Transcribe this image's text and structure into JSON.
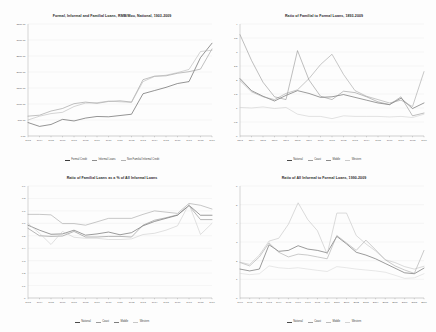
{
  "page": {
    "background": "#fdfdfd",
    "layout": "2x2 grid of line charts"
  },
  "chart_data": [
    {
      "id": "formal-informal-familial-loans",
      "type": "line",
      "title": "Formal, Informal and Familial Loans, RMB/Mou, National, 1903-2009",
      "xlabel": "",
      "ylabel": "",
      "ylim": [
        0,
        3500
      ],
      "yticks": [
        0,
        500,
        1000,
        1500,
        2000,
        2500,
        3000,
        3500
      ],
      "ytick_labels": [
        "0.00",
        "500.00",
        "1000.00",
        "1500.00",
        "2000.00",
        "2500.00",
        "3000.00",
        "3500.00"
      ],
      "grid": true,
      "legend_position": "bottom",
      "x": [
        "1903",
        "1904",
        "1905",
        "1906",
        "1907",
        "1908",
        "1909",
        "1910",
        "1911",
        "1912",
        "1913",
        "1914",
        "1915",
        "1916",
        "1917",
        "1918",
        "1919"
      ],
      "categories": [
        "1903",
        "1904",
        "1905",
        "1906",
        "1907",
        "1908",
        "1909",
        "1910",
        "1911",
        "1912",
        "1913",
        "1914",
        "1915",
        "1916",
        "1917",
        "1918",
        "1919"
      ],
      "series": [
        {
          "name": "Formal Credit",
          "color": "#3c3c3c",
          "values": [
            420,
            300,
            360,
            520,
            470,
            560,
            610,
            600,
            640,
            680,
            1320,
            1420,
            1520,
            1640,
            1700,
            2450,
            2900
          ]
        },
        {
          "name": "Informal Loans",
          "color": "#8e8e8e",
          "values": [
            620,
            650,
            780,
            860,
            1010,
            1060,
            1020,
            1080,
            1100,
            1060,
            1760,
            1870,
            1880,
            1960,
            2010,
            2090,
            2720
          ]
        },
        {
          "name": "Non Familial Informal Credit",
          "color": "#b2b2b2",
          "values": [
            500,
            620,
            700,
            740,
            920,
            1030,
            1040,
            1090,
            1070,
            1050,
            1700,
            1860,
            1900,
            1980,
            2080,
            2640,
            2680
          ]
        }
      ],
      "legend": [
        "Formal Credit",
        "Informal Loans",
        "Non Familial Informal Credit"
      ]
    },
    {
      "id": "ratio-familial-to-formal",
      "type": "line",
      "title": "Ratio of Familial to Formal Loans, 1893-2009",
      "xlabel": "",
      "ylabel": "",
      "ylim": [
        0,
        4
      ],
      "yticks": [
        0,
        0.5,
        1,
        1.5,
        2,
        2.5,
        3,
        3.5,
        4
      ],
      "ytick_labels": [
        "0",
        "0.5",
        "1",
        "1.5",
        "2",
        "2.5",
        "3",
        "3.5",
        "4"
      ],
      "grid": true,
      "legend_position": "bottom",
      "x": [
        "1893",
        "1894",
        "1895",
        "1896",
        "1897",
        "1898",
        "1899",
        "1900",
        "1901",
        "1902",
        "1903",
        "1904",
        "1905",
        "1906",
        "1907",
        "1908",
        "1909"
      ],
      "categories": [
        "1893",
        "1894",
        "1895",
        "1896",
        "1897",
        "1898",
        "1899",
        "1900",
        "1901",
        "1902",
        "1903",
        "1904",
        "1905",
        "1906",
        "1907",
        "1908",
        "1909"
      ],
      "series": [
        {
          "name": "National",
          "color": "#4a4a4a",
          "values": [
            2.05,
            1.62,
            1.42,
            1.25,
            1.45,
            1.62,
            1.52,
            1.38,
            1.4,
            1.48,
            1.38,
            1.28,
            1.18,
            1.12,
            1.35,
            0.98,
            1.18
          ]
        },
        {
          "name": "Coast",
          "color": "#9b9b9b",
          "values": [
            1.98,
            1.58,
            1.4,
            1.3,
            1.52,
            1.65,
            2.05,
            2.55,
            2.92,
            2.2,
            1.62,
            1.42,
            1.3,
            1.18,
            1.28,
            1.05,
            2.3
          ]
        },
        {
          "name": "Middle",
          "color": "#8a8a8a",
          "values": [
            3.62,
            2.7,
            1.92,
            1.4,
            1.3,
            3.05,
            2.0,
            1.42,
            1.3,
            1.6,
            1.55,
            1.4,
            1.22,
            1.12,
            1.4,
            0.72,
            0.82
          ]
        },
        {
          "name": "Western",
          "color": "#cbcbcb",
          "values": [
            1.02,
            1.0,
            1.04,
            0.98,
            1.02,
            0.78,
            0.7,
            0.7,
            0.62,
            0.72,
            0.7,
            0.7,
            0.7,
            0.68,
            0.7,
            0.66,
            0.78
          ]
        }
      ],
      "legend": [
        "National",
        "Coast",
        "Middle",
        "Western"
      ]
    },
    {
      "id": "familial-share-of-informal",
      "type": "line",
      "title": "Ratio of Familial Loans as a % of All Informal Loans",
      "xlabel": "",
      "ylabel": "",
      "ylim": [
        0,
        0.9
      ],
      "yticks": [
        0,
        0.1,
        0.2,
        0.3,
        0.4,
        0.5,
        0.6,
        0.7,
        0.8,
        0.9
      ],
      "ytick_labels": [
        "0",
        "0.1",
        "0.2",
        "0.3",
        "0.4",
        "0.5",
        "0.6",
        "0.7",
        "0.8",
        "0.9"
      ],
      "grid": true,
      "legend_position": "bottom",
      "x": [
        "1903",
        "1904",
        "1905",
        "1906",
        "1907",
        "1908",
        "1909",
        "1910",
        "1911",
        "1912",
        "1913",
        "1914",
        "1915",
        "1916",
        "1917",
        "1918",
        "1919"
      ],
      "categories": [
        "1903",
        "1904",
        "1905",
        "1906",
        "1907",
        "1908",
        "1909",
        "1910",
        "1911",
        "1912",
        "1913",
        "1914",
        "1915",
        "1916",
        "1917",
        "1918",
        "1919"
      ],
      "series": [
        {
          "name": "National",
          "color": "#4a4a4a",
          "values": [
            0.585,
            0.545,
            0.512,
            0.515,
            0.545,
            0.505,
            0.515,
            0.53,
            0.508,
            0.525,
            0.58,
            0.615,
            0.64,
            0.665,
            0.745,
            0.665,
            0.665
          ]
        },
        {
          "name": "Coast",
          "color": "#9b9b9b",
          "values": [
            0.672,
            0.672,
            0.668,
            0.598,
            0.598,
            0.585,
            0.612,
            0.64,
            0.64,
            0.64,
            0.672,
            0.7,
            0.69,
            0.68,
            0.76,
            0.745,
            0.715
          ]
        },
        {
          "name": "Middle",
          "color": "#7d7d7d",
          "values": [
            0.56,
            0.5,
            0.495,
            0.498,
            0.535,
            0.49,
            0.49,
            0.495,
            0.495,
            0.49,
            0.585,
            0.625,
            0.645,
            0.668,
            0.742,
            0.63,
            0.63
          ]
        },
        {
          "name": "Western",
          "color": "#c8c8c8",
          "values": [
            0.6,
            0.52,
            0.43,
            0.535,
            0.488,
            0.48,
            0.48,
            0.47,
            0.47,
            0.475,
            0.51,
            0.52,
            0.545,
            0.58,
            0.755,
            0.51,
            0.6
          ]
        }
      ],
      "legend": [
        "National",
        "Coast",
        "Middle",
        "Western"
      ]
    },
    {
      "id": "ratio-informal-to-formal",
      "type": "line",
      "title": "Ratio of All Informal to Formal Loans, 1990-2009",
      "xlabel": "",
      "ylabel": "",
      "ylim": [
        0,
        6
      ],
      "yticks": [
        0,
        1,
        2,
        3,
        4,
        5,
        6
      ],
      "ytick_labels": [
        "0",
        "1",
        "2",
        "3",
        "4",
        "5",
        "6"
      ],
      "grid": true,
      "legend_position": "bottom",
      "x": [
        "1990",
        "1991",
        "1992",
        "1993",
        "1994",
        "1995",
        "1996",
        "1997",
        "1998",
        "1999",
        "2000",
        "2001",
        "2002",
        "2003",
        "2004",
        "2005",
        "2006",
        "2007",
        "2008",
        "2009"
      ],
      "categories": [
        "1990",
        "1991",
        "1992",
        "1993",
        "1994",
        "1995",
        "1996",
        "1997",
        "1998",
        "1999",
        "2000",
        "2001",
        "2002",
        "2003",
        "2004",
        "2005",
        "2006",
        "2007",
        "2008",
        "2009"
      ],
      "series": [
        {
          "name": "National",
          "color": "#4a4a4a",
          "values": [
            1.55,
            1.45,
            1.55,
            2.85,
            2.5,
            2.55,
            2.8,
            2.62,
            2.55,
            2.42,
            3.3,
            2.9,
            2.45,
            2.3,
            2.1,
            1.85,
            1.6,
            1.35,
            1.3,
            1.6
          ]
        },
        {
          "name": "Coast",
          "color": "#a0a0a0",
          "values": [
            1.9,
            1.72,
            2.2,
            2.95,
            2.45,
            2.2,
            2.35,
            2.3,
            2.2,
            2.1,
            3.35,
            2.95,
            2.55,
            3.1,
            2.58,
            2.05,
            1.72,
            1.5,
            1.32,
            2.55
          ]
        },
        {
          "name": "Middle",
          "color": "#bdbdbd",
          "values": [
            1.92,
            1.8,
            2.3,
            3.05,
            3.2,
            3.95,
            5.1,
            4.2,
            3.6,
            2.35,
            4.55,
            4.55,
            3.35,
            2.9,
            2.52,
            2.05,
            1.9,
            1.68,
            1.55,
            1.7
          ]
        },
        {
          "name": "Western",
          "color": "#d4d4d4",
          "values": [
            1.32,
            1.25,
            1.3,
            1.72,
            1.62,
            1.58,
            1.62,
            1.55,
            1.48,
            1.42,
            1.68,
            1.62,
            1.55,
            1.5,
            1.45,
            1.38,
            1.22,
            1.05,
            1.08,
            1.3
          ]
        }
      ],
      "legend": [
        "National",
        "Coast",
        "Middle",
        "Western"
      ]
    }
  ]
}
